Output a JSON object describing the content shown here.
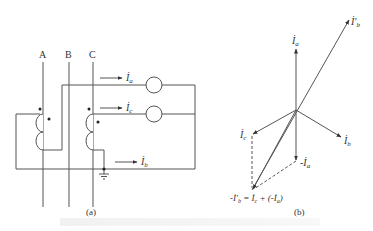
{
  "figure": {
    "panel_a": {
      "label": "(a)",
      "phases": [
        "A",
        "B",
        "C"
      ],
      "currents": {
        "ia": {
          "symbol": "İ",
          "sub": "a"
        },
        "ic": {
          "symbol": "İ",
          "sub": "c"
        },
        "ib": {
          "symbol": "İ",
          "sub": "b"
        }
      }
    },
    "panel_b": {
      "label": "(b)",
      "phasors": {
        "ia": {
          "symbol": "İ",
          "sub": "a"
        },
        "ib_prime": {
          "symbol": "İ'",
          "sub": "b"
        },
        "ic": {
          "symbol": "İ",
          "sub": "c"
        },
        "ib": {
          "symbol": "İ",
          "sub": "b"
        },
        "neg_ia": {
          "symbol": "-İ",
          "sub": "a"
        }
      },
      "equation": {
        "lhs": "-İ'",
        "lhs_sub": "b",
        "eq": " = İ",
        "t1_sub": "c",
        "plus": " + (-İ",
        "t2_sub": "a",
        "close": ")"
      }
    },
    "caption_visible": false
  },
  "colors": {
    "line": "#444444",
    "text": "#333333",
    "background": "#ffffff"
  }
}
